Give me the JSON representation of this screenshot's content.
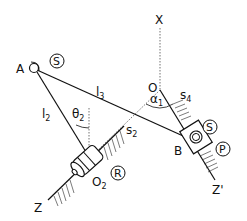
{
  "diagram": {
    "labels": {
      "A": "A",
      "O": "O",
      "X": "X",
      "Z": "Z",
      "Z_prime": "Z'",
      "B": "B",
      "O2_main": "O",
      "O2_sub": "2",
      "l2_main": "l",
      "l2_sub": "2",
      "l3_main": "l",
      "l3_sub": "3",
      "s2_main": "s",
      "s2_sub": "2",
      "s4_main": "s",
      "s4_sub": "4",
      "theta2_main": "θ",
      "theta2_sub": "2",
      "alpha1_main": "α",
      "alpha1_sub": "1"
    },
    "joint_types": {
      "joint_A": "S",
      "joint_B_spherical": "S",
      "joint_B_prismatic": "P",
      "joint_O2_revolute": "R"
    }
  }
}
